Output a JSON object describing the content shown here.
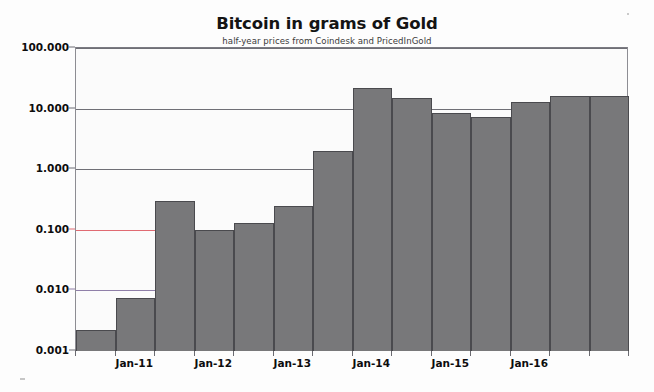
{
  "chart_data": {
    "type": "bar",
    "title": "Bitcoin in grams of Gold",
    "subtitle": "half-year prices from Coindesk and PricedInGold",
    "xlabel": "",
    "ylabel": "",
    "yscale": "log",
    "ylim": [
      0.001,
      100
    ],
    "grid": true,
    "legend": null,
    "ytick_labels": [
      "100.000",
      "10.000",
      "1.000",
      "0.100",
      "0.010",
      "0.001"
    ],
    "ytick_values": [
      100,
      10,
      1,
      0.1,
      0.01,
      0.001
    ],
    "xtick_labels": [
      "Jan-11",
      "Jan-12",
      "Jan-13",
      "Jan-14",
      "Jan-15",
      "Jan-16"
    ],
    "categories": [
      "Jul-10",
      "Jan-11",
      "Jul-11",
      "Jan-12",
      "Jul-12",
      "Jan-13",
      "Jul-13",
      "Jan-14",
      "Jul-14",
      "Jan-15",
      "Jul-15",
      "Jan-16",
      "Jul-16",
      "Jan-17"
    ],
    "values": [
      0.0022,
      0.0075,
      0.3,
      0.098,
      0.13,
      0.25,
      2.0,
      22.0,
      15.0,
      8.6,
      7.2,
      13.0,
      16.0,
      16.0
    ],
    "series_name": "Bitcoin price in grams of gold",
    "bar_color": "#78787a",
    "bar_edge_color": "#4a4a4e",
    "gridline_colors": {
      "100": "#6f6f76",
      "10": "#6f6f76",
      "1": "#6f6f76",
      "0.1": "#e06a72",
      "0.01": "#8f7fa8"
    }
  }
}
